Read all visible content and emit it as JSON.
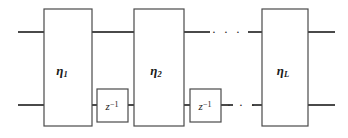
{
  "figure": {
    "background_color": "#ffffff",
    "line_color": "#4a4a4a",
    "text_color": "#1b1b1b",
    "width": 348,
    "height": 138
  },
  "stages": [
    {
      "id": "stage-1",
      "label_base": "η",
      "label_sub": "1",
      "x": 44,
      "y": 9,
      "w": 48,
      "h": 117,
      "label_cx": 62,
      "label_cy": 71
    },
    {
      "id": "stage-2",
      "label_base": "η",
      "label_sub": "2",
      "x": 134,
      "y": 9,
      "w": 50,
      "h": 117,
      "label_cx": 156,
      "label_cy": 71
    },
    {
      "id": "stage-L",
      "label_base": "η",
      "label_sub": "L",
      "x": 262,
      "y": 9,
      "w": 46,
      "h": 117,
      "label_cx": 283,
      "label_cy": 71
    }
  ],
  "delays": [
    {
      "id": "delay-1",
      "label_base": "z",
      "label_sup": "−1",
      "x": 97,
      "y": 89,
      "w": 31,
      "h": 33,
      "label_cx": 112,
      "label_cy": 105
    },
    {
      "id": "delay-2",
      "label_base": "z",
      "label_sup": "−1",
      "x": 190,
      "y": 89,
      "w": 31,
      "h": 33,
      "label_cx": 205,
      "label_cy": 105
    }
  ],
  "wires": {
    "top_y": 32,
    "bottom_y": 105,
    "segments": [
      {
        "id": "top-in",
        "x1": 18,
        "x2": 44,
        "y": 32
      },
      {
        "id": "top-1-to-2",
        "x1": 92,
        "x2": 134,
        "y": 32
      },
      {
        "id": "top-2-to-dots",
        "x1": 184,
        "x2": 205,
        "y": 32
      },
      {
        "id": "top-dots-to-L",
        "x1": 250,
        "x2": 262,
        "y": 32
      },
      {
        "id": "top-out",
        "x1": 308,
        "x2": 335,
        "y": 32
      },
      {
        "id": "bottom-in",
        "x1": 18,
        "x2": 44,
        "y": 105
      },
      {
        "id": "bottom-1-to-delay1",
        "x1": 92,
        "x2": 97,
        "y": 105
      },
      {
        "id": "bottom-delay1-to-2",
        "x1": 128,
        "x2": 134,
        "y": 105
      },
      {
        "id": "bottom-2-to-delay2",
        "x1": 184,
        "x2": 190,
        "y": 105
      },
      {
        "id": "bottom-delay2-to-dots",
        "x1": 221,
        "x2": 231,
        "y": 105
      },
      {
        "id": "bottom-dots-to-L",
        "x1": 253,
        "x2": 262,
        "y": 105
      },
      {
        "id": "bottom-out",
        "x1": 308,
        "x2": 335,
        "y": 105
      }
    ]
  },
  "ellipses": [
    {
      "id": "ellipsis-top",
      "glyph": "· · ·",
      "cx": 227,
      "cy": 31
    },
    {
      "id": "ellipsis-bottom",
      "glyph": "· · ·",
      "cx": 242,
      "cy": 104
    }
  ]
}
